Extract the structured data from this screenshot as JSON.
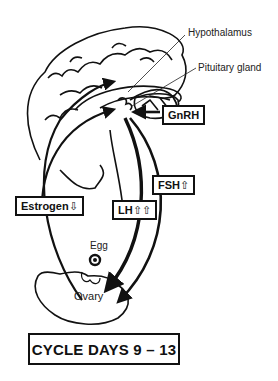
{
  "diagram": {
    "title": "CYCLE DAYS 9 – 13",
    "labels": {
      "hypothalamus": "Hypothalamus",
      "pituitary": "Pituitary gland",
      "egg": "Egg",
      "ovary": "Ovary"
    },
    "hormones": {
      "gnrh": {
        "name": "GnRH",
        "arrows": ""
      },
      "fsh": {
        "name": "FSH",
        "arrows": "⇧"
      },
      "lh": {
        "name": "LH",
        "arrows": "⇧⇧"
      },
      "estrogen": {
        "name": "Estrogen",
        "arrows": "⇩"
      }
    },
    "colors": {
      "ink": "#111111",
      "background": "#ffffff"
    }
  }
}
